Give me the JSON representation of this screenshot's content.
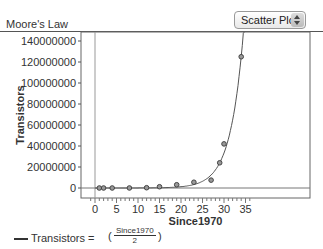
{
  "header": {
    "title": "Moore's Law",
    "view_select": {
      "selected": "Scatter Plot"
    }
  },
  "legend": {
    "label": "Transistors =",
    "formula_numerator": "Since1970",
    "formula_denominator": "2",
    "paren_open": "(",
    "paren_close": ")"
  },
  "chart_data": {
    "type": "scatter",
    "title": "Moore's Law",
    "xlabel": "Since1970",
    "ylabel": "Transistors",
    "xlim": [
      -2,
      37
    ],
    "ylim": [
      -6000000,
      148000000
    ],
    "x_ticks": [
      0,
      5,
      10,
      15,
      20,
      25,
      30,
      35
    ],
    "y_ticks": [
      0,
      20000000,
      40000000,
      60000000,
      80000000,
      100000000,
      120000000,
      140000000
    ],
    "y_tick_labels": [
      "0",
      "20000000",
      "40000000",
      "60000000",
      "80000000",
      "100000000",
      "120000000",
      "140000000"
    ],
    "x_tick_labels": [
      "0",
      "5",
      "10",
      "15",
      "20",
      "25",
      "30",
      "35"
    ],
    "grid": false,
    "series": [
      {
        "name": "Transistors",
        "x": [
          1,
          2,
          4,
          8,
          12,
          15,
          19,
          23,
          27,
          29,
          30,
          34
        ],
        "y": [
          2300,
          3500,
          6000,
          29000,
          275000,
          1200000,
          3100000,
          5500000,
          7500000,
          24000000,
          42000000,
          125000000
        ]
      }
    ],
    "fit": {
      "name": "Transistors",
      "type": "exponential",
      "expression": "Transistors = (Since1970 / 2)"
    },
    "legend_position": "bottom-left"
  }
}
